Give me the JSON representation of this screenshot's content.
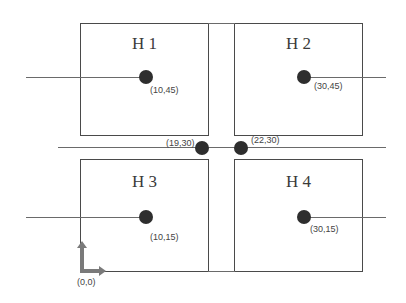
{
  "diagram": {
    "rooms": [
      {
        "id": "H1",
        "label": "H 1",
        "sensor": {
          "coord": "(10,45)"
        }
      },
      {
        "id": "H2",
        "label": "H 2",
        "sensor": {
          "coord": "(30,45)"
        }
      },
      {
        "id": "H3",
        "label": "H 3",
        "sensor": {
          "coord": "(10,15)"
        }
      },
      {
        "id": "H4",
        "label": "H 4",
        "sensor": {
          "coord": "(30,15)"
        }
      }
    ],
    "corridor_points": [
      {
        "coord": "(19,30)"
      },
      {
        "coord": "(22,30)"
      }
    ],
    "origin": {
      "label": "(0,0)"
    },
    "colors": {
      "room_border": "#4a4a4a",
      "dot": "#2e2e2e",
      "line": "#6a6a6a",
      "axis": "#7a7a7a"
    }
  }
}
